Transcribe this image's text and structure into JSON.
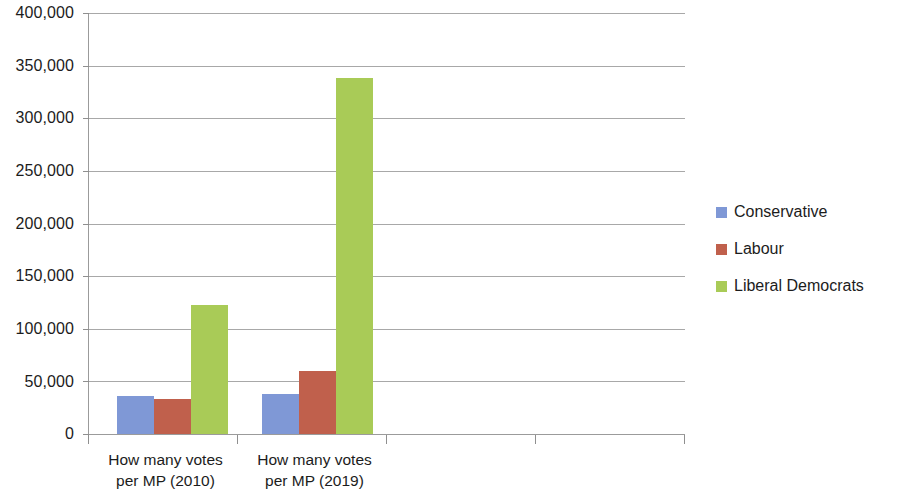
{
  "chart_data": {
    "type": "bar",
    "title": "",
    "subtitle": "",
    "xlabel": "",
    "ylabel": "",
    "grid": true,
    "legend_position": "right",
    "ylim": [
      0,
      400000
    ],
    "ytick_interval": 50000,
    "ytick_labels": [
      "400,000",
      "350,000",
      "300,000",
      "250,000",
      "200,000",
      "150,000",
      "100,000",
      "50,000",
      "0"
    ],
    "ytick_values": [
      400000,
      350000,
      300000,
      250000,
      200000,
      150000,
      100000,
      50000,
      0
    ],
    "categories": [
      "How many votes\nper MP (2010)",
      "How many votes\nper MP (2019)"
    ],
    "series": [
      {
        "name": "Conservative",
        "color": "#7f98d6",
        "values": [
          36000,
          38000
        ]
      },
      {
        "name": "Labour",
        "color": "#c0604c",
        "values": [
          33000,
          60000
        ]
      },
      {
        "name": "Liberal Democrats",
        "color": "#a9cb57",
        "values": [
          123000,
          338000
        ]
      }
    ]
  },
  "legend": {
    "items": [
      {
        "label": "Conservative",
        "color": "#7f98d6"
      },
      {
        "label": "Labour",
        "color": "#c0604c"
      },
      {
        "label": "Liberal Democrats",
        "color": "#a9cb57"
      }
    ]
  }
}
